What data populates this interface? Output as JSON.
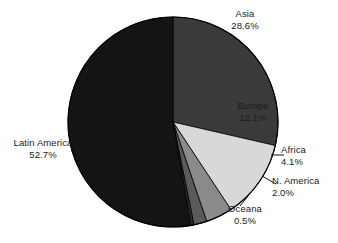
{
  "chart_data": {
    "type": "pie",
    "title": "",
    "subtitle": "",
    "xlabel": "",
    "ylabel": "",
    "grid": false,
    "legend_position": "none",
    "labels_position": "outside-with-leader-lines",
    "start_angle_deg": 0,
    "direction": "clockwise",
    "units": "percent",
    "categories": [
      "Asia",
      "Europe",
      "Africa",
      "N. America",
      "Oceana",
      "Latin America"
    ],
    "values": [
      28.6,
      12.1,
      4.1,
      2.0,
      0.5,
      52.7
    ],
    "value_labels": [
      "28.6%",
      "12.1%",
      "4.1%",
      "2.0%",
      "0.5%",
      "52.7%"
    ],
    "colors": [
      "#3a3a3a",
      "#d8d8d8",
      "#8a8a8a",
      "#5a5a5a",
      "#2a2a2a",
      "#141414"
    ],
    "slices": [
      {
        "name": "Asia",
        "value": 28.6,
        "value_label": "28.6%",
        "color": "#3a3a3a"
      },
      {
        "name": "Europe",
        "value": 12.1,
        "value_label": "12.1%",
        "color": "#d8d8d8"
      },
      {
        "name": "Africa",
        "value": 4.1,
        "value_label": "4.1%",
        "color": "#8a8a8a"
      },
      {
        "name": "N. America",
        "value": 2.0,
        "value_label": "2.0%",
        "color": "#5a5a5a"
      },
      {
        "name": "Oceana",
        "value": 0.5,
        "value_label": "0.5%",
        "color": "#2a2a2a"
      },
      {
        "name": "Latin America",
        "value": 52.7,
        "value_label": "52.7%",
        "color": "#141414"
      }
    ]
  },
  "labels": {
    "asia": {
      "name": "Asia",
      "value": "28.6%"
    },
    "europe": {
      "name": "Europe",
      "value": "12.1%"
    },
    "africa": {
      "name": "Africa",
      "value": "4.1%"
    },
    "namerica": {
      "name": "N. America",
      "value": "2.0%"
    },
    "oceana": {
      "name": "Oceana",
      "value": "0.5%"
    },
    "latin_america": {
      "name": "Latin America",
      "value": "52.7%"
    }
  },
  "geometry": {
    "center_x": 173,
    "center_y": 122,
    "radius": 105,
    "outline_color": "#000000"
  }
}
